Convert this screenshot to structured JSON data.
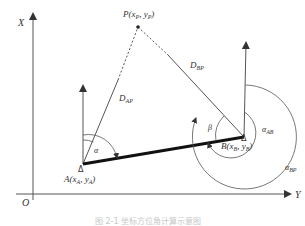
{
  "diagram": {
    "axes": {
      "x_axis_label": "X",
      "y_axis_label": "Y",
      "origin_label": "O"
    },
    "points": {
      "P": {
        "name": "P",
        "coord_label": "P(x",
        "sub1": "P",
        "mid": ", y",
        "sub2": "P",
        "close": ")"
      },
      "A": {
        "name": "A",
        "coord_label": "A(x",
        "sub1": "A",
        "mid": ", y",
        "sub2": "A",
        "close": ")",
        "marker": "Δ"
      },
      "B": {
        "name": "B",
        "coord_label": "B(x",
        "sub1": "B",
        "mid": ", y",
        "sub2": "B",
        "close": ")",
        "marker": "Δ"
      }
    },
    "distances": {
      "AP": {
        "main": "D",
        "sub": "AP"
      },
      "BP": {
        "main": "D",
        "sub": "BP"
      }
    },
    "angles": {
      "alpha": "α",
      "beta": "β",
      "alpha_AB": {
        "main": "α",
        "sub": "AB"
      },
      "alpha_BP": {
        "main": "α",
        "sub": "BP"
      }
    },
    "caption": "图 2-1  坐标方位角计算示意图",
    "colors": {
      "line": "#555555",
      "thick_line": "#111111",
      "text": "#333333"
    }
  }
}
